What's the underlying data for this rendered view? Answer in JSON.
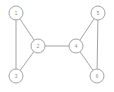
{
  "figure": {
    "width": 114,
    "height": 92,
    "background_color": "#ffffff"
  },
  "style": {
    "edge_color": "#999999",
    "edge_width": 0.9,
    "node_fill": "#ffffff",
    "node_stroke": "#9a9a9a",
    "node_stroke_width": 0.9,
    "node_radius": 7,
    "label_color": "#8a8a8a",
    "label_font_size": 4.6
  },
  "chart_data": {
    "type": "diagram",
    "graph_type": "undirected",
    "title": "",
    "node_count": 6,
    "edge_count": 7,
    "nodes": [
      {
        "id": "n1",
        "label": "1",
        "x": 16,
        "y": 13
      },
      {
        "id": "n2",
        "label": "2",
        "x": 38,
        "y": 46
      },
      {
        "id": "n3",
        "label": "3",
        "x": 16,
        "y": 76
      },
      {
        "id": "n4",
        "label": "4",
        "x": 76,
        "y": 46
      },
      {
        "id": "n5",
        "label": "5",
        "x": 98,
        "y": 13
      },
      {
        "id": "n6",
        "label": "6",
        "x": 97,
        "y": 76
      }
    ],
    "edges": [
      {
        "id": "e1",
        "source": "n1",
        "target": "n2",
        "kind": "triangle-left"
      },
      {
        "id": "e2",
        "source": "n1",
        "target": "n3",
        "kind": "triangle-left"
      },
      {
        "id": "e3",
        "source": "n2",
        "target": "n3",
        "kind": "triangle-left"
      },
      {
        "id": "e4",
        "source": "n2",
        "target": "n4",
        "kind": "bridge"
      },
      {
        "id": "e5",
        "source": "n4",
        "target": "n5",
        "kind": "triangle-right"
      },
      {
        "id": "e6",
        "source": "n4",
        "target": "n6",
        "kind": "triangle-right"
      },
      {
        "id": "e7",
        "source": "n5",
        "target": "n6",
        "kind": "triangle-right"
      }
    ]
  }
}
